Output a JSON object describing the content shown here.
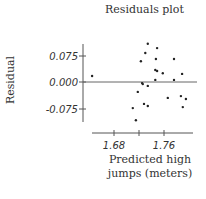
{
  "chart_data": {
    "type": "scatter",
    "title": "Residuals plot",
    "xlabel": "Predicted high jumps (meters)",
    "xlabel_lines": [
      "Predicted high",
      "jumps (meters)"
    ],
    "ylabel": "Residual",
    "x_ticks": [
      1.68,
      1.72,
      1.76
    ],
    "x_tick_labels": [
      "1.68",
      "1.76"
    ],
    "y_ticks": [
      0.075,
      0.0,
      -0.075
    ],
    "y_tick_labels": [
      "0.075",
      "0.000",
      "-0.075"
    ],
    "xlim": [
      1.67,
      1.81
    ],
    "ylim": [
      -0.11,
      0.11
    ],
    "grid": false,
    "reference_line_y": 0.0,
    "series": [
      {
        "name": "Residuals",
        "points": [
          {
            "x": 1.645,
            "y": 0.017
          },
          {
            "x": 1.734,
            "y": 0.108
          },
          {
            "x": 1.749,
            "y": 0.096
          },
          {
            "x": 1.73,
            "y": 0.082
          },
          {
            "x": 1.747,
            "y": 0.065
          },
          {
            "x": 1.723,
            "y": 0.059
          },
          {
            "x": 1.776,
            "y": 0.065
          },
          {
            "x": 1.746,
            "y": 0.034
          },
          {
            "x": 1.749,
            "y": 0.031
          },
          {
            "x": 1.758,
            "y": 0.025
          },
          {
            "x": 1.789,
            "y": 0.023
          },
          {
            "x": 1.746,
            "y": 0.006
          },
          {
            "x": 1.776,
            "y": 0.006
          },
          {
            "x": 1.725,
            "y": -0.003
          },
          {
            "x": 1.726,
            "y": -0.006
          },
          {
            "x": 1.734,
            "y": -0.011
          },
          {
            "x": 1.718,
            "y": -0.028
          },
          {
            "x": 1.766,
            "y": -0.045
          },
          {
            "x": 1.787,
            "y": -0.04
          },
          {
            "x": 1.795,
            "y": -0.048
          },
          {
            "x": 1.728,
            "y": -0.062
          },
          {
            "x": 1.734,
            "y": -0.068
          },
          {
            "x": 1.71,
            "y": -0.074
          },
          {
            "x": 1.79,
            "y": -0.071
          },
          {
            "x": 1.715,
            "y": -0.108
          }
        ]
      }
    ]
  }
}
